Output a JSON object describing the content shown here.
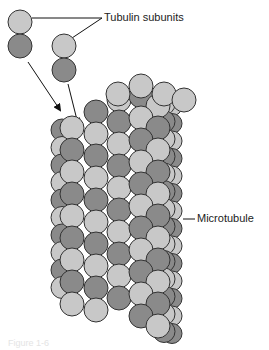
{
  "figure": {
    "labels": {
      "subunits": "Tubulin subunits",
      "polymer": "Microtubule"
    },
    "caption": "Figure 1-6",
    "colors": {
      "alpha_tubulin": "#c8c8c8",
      "beta_tubulin": "#8a8a8a",
      "outline": "#333333",
      "background": "#ffffff"
    },
    "free_dimers": [
      {
        "cx": 20,
        "cy": 22,
        "r": 12
      },
      {
        "cx": 64,
        "cy": 45,
        "r": 12
      }
    ],
    "microtubule": {
      "rows": 14,
      "visible_columns": 6,
      "subunit_radius": 12
    }
  }
}
